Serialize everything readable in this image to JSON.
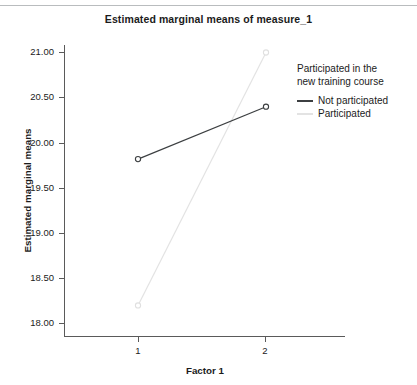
{
  "chart_data": {
    "type": "line",
    "title": "Estimated marginal means of measure_1",
    "xlabel": "Factor 1",
    "ylabel": "Estimated marginal means",
    "categories": [
      "1",
      "2"
    ],
    "x": [
      1,
      2
    ],
    "xtick_labels": [
      "1",
      "2"
    ],
    "ytick_labels": [
      "18.00",
      "18.50",
      "19.00",
      "19.50",
      "20.00",
      "20.50",
      "21.00"
    ],
    "yticks": [
      18.0,
      18.5,
      19.0,
      19.5,
      20.0,
      20.5,
      21.0
    ],
    "ylim": [
      17.85,
      21.15
    ],
    "xlim": [
      0.42,
      2.65
    ],
    "grid": false,
    "legend_position": "right",
    "legend_title": "Participated in the new training course",
    "series": [
      {
        "name": "Not participated",
        "values": [
          19.82,
          20.4
        ],
        "color": "#3c3f41",
        "marker": "open-circle"
      },
      {
        "name": "Participated",
        "values": [
          18.2,
          21.0
        ],
        "color": "#e3e3e3",
        "marker": "open-circle"
      }
    ]
  },
  "legend": {
    "title": "Participated in the new training course",
    "title_line_1": "Participated in the",
    "title_line_2": "new training course",
    "items": [
      {
        "label": "Not participated",
        "color": "#3c3f41"
      },
      {
        "label": "Participated",
        "color": "#e3e3e3"
      }
    ]
  },
  "axes": {
    "y_title": "Estimated marginal means",
    "x_title": "Factor 1",
    "y_labels": [
      "21.00",
      "20.50",
      "20.00",
      "19.50",
      "19.00",
      "18.50",
      "18.00"
    ],
    "x_labels": [
      "1",
      "2"
    ]
  }
}
